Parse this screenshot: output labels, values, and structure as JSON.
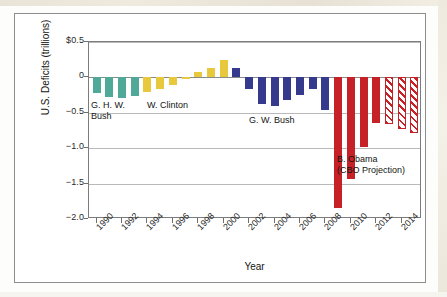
{
  "figure": {
    "y_axis_title": "U.S. Deficits (trillions)",
    "x_axis_title": "Year"
  },
  "annotations": [
    {
      "id": "ghw-bush",
      "line1": "G. H. W.",
      "line2": "Bush"
    },
    {
      "id": "clinton",
      "line1": "W. Clinton",
      "line2": ""
    },
    {
      "id": "gw-bush",
      "line1": "G. W. Bush",
      "line2": ""
    },
    {
      "id": "obama",
      "line1": "B. Obama",
      "line2": "(CBO Projection)"
    }
  ],
  "colors": {
    "ghw_bush": "#4fa898",
    "clinton": "#e8c83c",
    "gw_bush": "#363a8c",
    "obama": "#c62127",
    "grid": "#b9b9b9",
    "axis": "#7c7c7c"
  },
  "chart_data": {
    "type": "bar",
    "title": "",
    "subtitle": "",
    "xlabel": "Year",
    "ylabel": "U.S. Deficits (trillions)",
    "ylim": [
      -2.0,
      0.5
    ],
    "yticks": [
      "$0.5",
      "0",
      "-0.5",
      "-1.0",
      "-1.5",
      "-2.0"
    ],
    "ytick_values": [
      0.5,
      0,
      -0.5,
      -1.0,
      -1.5,
      -2.0
    ],
    "xtick_labels": [
      "1990",
      "1992",
      "1994",
      "1996",
      "1998",
      "2000",
      "2002",
      "2004",
      "2006",
      "2008",
      "2010",
      "2012",
      "2014"
    ],
    "xlim": [
      1989.4,
      2015.6
    ],
    "grid": true,
    "legend": "none",
    "categories": [
      1990,
      1991,
      1992,
      1993,
      1994,
      1995,
      1996,
      1997,
      1998,
      1999,
      2000,
      2001,
      2002,
      2003,
      2004,
      2005,
      2006,
      2007,
      2008,
      2009,
      2010,
      2011,
      2012,
      2013,
      2014,
      2015
    ],
    "values": [
      -0.22,
      -0.27,
      -0.29,
      -0.26,
      -0.2,
      -0.16,
      -0.11,
      -0.02,
      0.07,
      0.13,
      0.24,
      0.13,
      -0.16,
      -0.38,
      -0.41,
      -0.32,
      -0.25,
      -0.16,
      -0.46,
      -1.85,
      -1.43,
      -0.98,
      -0.65,
      -0.66,
      -0.73,
      -0.78
    ],
    "series": [
      {
        "name": "G. H. W. Bush",
        "color": "#4fa898",
        "style": "solid",
        "points": [
          {
            "year": 1990,
            "value": -0.22
          },
          {
            "year": 1991,
            "value": -0.27
          },
          {
            "year": 1992,
            "value": -0.29
          },
          {
            "year": 1993,
            "value": -0.26
          }
        ]
      },
      {
        "name": "W. Clinton",
        "color": "#e8c83c",
        "style": "solid",
        "points": [
          {
            "year": 1994,
            "value": -0.2
          },
          {
            "year": 1995,
            "value": -0.16
          },
          {
            "year": 1996,
            "value": -0.11
          },
          {
            "year": 1997,
            "value": -0.02
          },
          {
            "year": 1998,
            "value": 0.07
          },
          {
            "year": 1999,
            "value": 0.13
          },
          {
            "year": 2000,
            "value": 0.24
          }
        ]
      },
      {
        "name": "G. W. Bush",
        "color": "#363a8c",
        "style": "solid",
        "points": [
          {
            "year": 2001,
            "value": 0.13
          },
          {
            "year": 2002,
            "value": -0.16
          },
          {
            "year": 2003,
            "value": -0.38
          },
          {
            "year": 2004,
            "value": -0.41
          },
          {
            "year": 2005,
            "value": -0.32
          },
          {
            "year": 2006,
            "value": -0.25
          },
          {
            "year": 2007,
            "value": -0.16
          },
          {
            "year": 2008,
            "value": -0.46
          }
        ]
      },
      {
        "name": "B. Obama",
        "color": "#c62127",
        "style": "solid",
        "points": [
          {
            "year": 2009,
            "value": -1.85
          },
          {
            "year": 2010,
            "value": -1.43
          },
          {
            "year": 2011,
            "value": -0.98
          },
          {
            "year": 2012,
            "value": -0.65
          }
        ]
      },
      {
        "name": "B. Obama (CBO Projection)",
        "color": "#c62127",
        "style": "hatched",
        "points": [
          {
            "year": 2013,
            "value": -0.66
          },
          {
            "year": 2014,
            "value": -0.73
          },
          {
            "year": 2015,
            "value": -0.78
          }
        ]
      }
    ]
  }
}
